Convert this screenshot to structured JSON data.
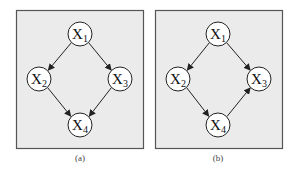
{
  "figure": {
    "colors": {
      "panel_fill": "#ebebeb",
      "panel_border": "#555555",
      "node_fill": "#ffffff",
      "node_stroke": "#222222",
      "edge": "#222222",
      "text": "#111111"
    },
    "panels": [
      {
        "id": "a",
        "caption": "(a)",
        "nodes": [
          {
            "id": "X1",
            "label": "X",
            "subscript": "1"
          },
          {
            "id": "X2",
            "label": "X",
            "subscript": "2"
          },
          {
            "id": "X3",
            "label": "X",
            "subscript": "3"
          },
          {
            "id": "X4",
            "label": "X",
            "subscript": "4"
          }
        ],
        "edges": [
          {
            "from": "X1",
            "to": "X2"
          },
          {
            "from": "X1",
            "to": "X3"
          },
          {
            "from": "X2",
            "to": "X4"
          },
          {
            "from": "X3",
            "to": "X4"
          }
        ]
      },
      {
        "id": "b",
        "caption": "(b)",
        "nodes": [
          {
            "id": "X1",
            "label": "X",
            "subscript": "1"
          },
          {
            "id": "X2",
            "label": "X",
            "subscript": "2"
          },
          {
            "id": "X3",
            "label": "X",
            "subscript": "3"
          },
          {
            "id": "X4",
            "label": "X",
            "subscript": "4"
          }
        ],
        "edges": [
          {
            "from": "X1",
            "to": "X2"
          },
          {
            "from": "X1",
            "to": "X3"
          },
          {
            "from": "X2",
            "to": "X4"
          },
          {
            "from": "X4",
            "to": "X3"
          }
        ]
      }
    ]
  }
}
